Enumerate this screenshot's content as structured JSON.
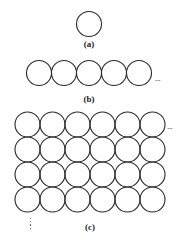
{
  "figure": {
    "stroke_color": "#2a2a2a",
    "background": "#ffffff",
    "circle_radius": 12.5,
    "panels": [
      {
        "id": "a",
        "label": "(a)",
        "description": "single circle",
        "circles": [
          [
            89,
            24
          ]
        ],
        "label_pos": [
          89,
          40
        ]
      },
      {
        "id": "b",
        "label": "(b)",
        "description": "one row of five touching circles continuing right",
        "circles": [
          [
            39,
            73
          ],
          [
            64,
            73
          ],
          [
            89,
            73
          ],
          [
            114,
            73
          ],
          [
            139,
            73
          ]
        ],
        "continuation": "...",
        "continuation_pos": [
          155,
          74
        ],
        "label_pos": [
          89,
          95
        ]
      },
      {
        "id": "c",
        "label": "(c)",
        "description": "square grid of 6 columns by 4 rows of touching circles, continuing right and down",
        "columns": 6,
        "rows": 4,
        "origin": [
          27.5,
          124.5
        ],
        "spacing": 25,
        "continuation_right": "...",
        "continuation_right_pos": [
          167,
          122
        ],
        "continuation_down_pos": [
          30,
          218
        ],
        "label_pos": [
          90,
          223
        ]
      }
    ]
  }
}
